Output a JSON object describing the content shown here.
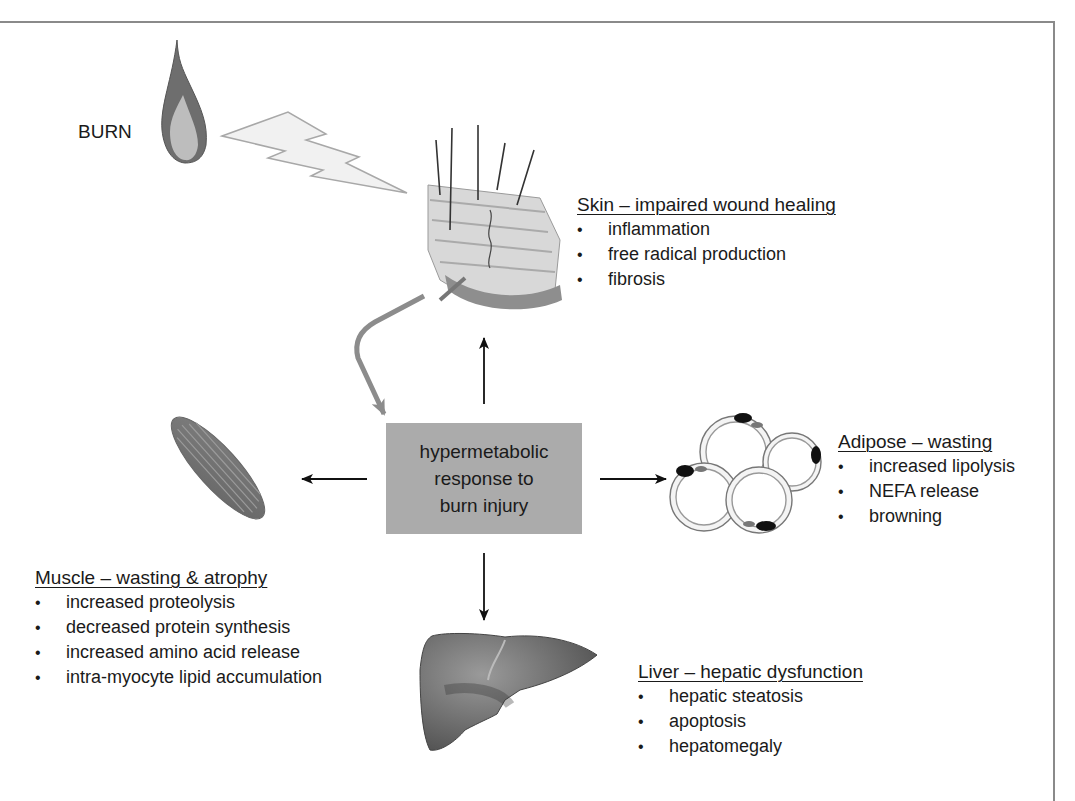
{
  "figure": {
    "burn_label": "BURN",
    "center": {
      "lines": [
        "hypermetabolic",
        "response to",
        "burn injury"
      ],
      "fill": "#ababab"
    },
    "organs": {
      "skin": {
        "heading": "Skin – impaired wound healing",
        "items": [
          "inflammation",
          "free radical production",
          "fibrosis"
        ]
      },
      "adipose": {
        "heading": "Adipose – wasting",
        "items": [
          "increased lipolysis",
          "NEFA release",
          "browning"
        ]
      },
      "muscle": {
        "heading": "Muscle – wasting & atrophy",
        "items": [
          "increased proteolysis",
          "decreased protein synthesis",
          "increased amino acid release",
          "intra-myocyte lipid accumulation"
        ]
      },
      "liver": {
        "heading": "Liver – hepatic dysfunction",
        "items": [
          "hepatic steatosis",
          "apoptosis",
          "hepatomegaly"
        ]
      }
    },
    "icons": [
      "flame-icon",
      "lightning-bolt-icon",
      "skin-cross-section-icon",
      "muscle-icon",
      "adipocytes-icon",
      "liver-icon"
    ],
    "colors": {
      "frame": "#8a8a8a",
      "arrow": "#111111",
      "feedback_arrow": "#8c8c8c"
    }
  }
}
